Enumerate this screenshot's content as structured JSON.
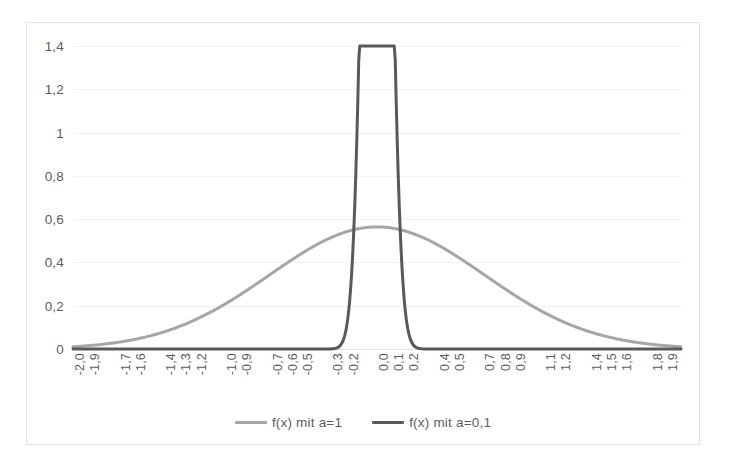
{
  "chart_data": {
    "type": "line",
    "title": "",
    "subtitle": "",
    "xlabel": "",
    "ylabel": "",
    "xlim": [
      -2.0,
      2.0
    ],
    "ylim": [
      0,
      1.4
    ],
    "grid": true,
    "legend_position": "bottom",
    "y_ticks": [
      "0",
      "0,2",
      "0,4",
      "0,6",
      "0,8",
      "1",
      "1,2",
      "1,4"
    ],
    "y_tick_values": [
      0,
      0.2,
      0.4,
      0.6,
      0.8,
      1.0,
      1.2,
      1.4
    ],
    "x_tick_labels": [
      "-2,0",
      "-1,9",
      "-1,7",
      "-1,6",
      "-1,4",
      "-1,3",
      "-1,2",
      "-1,0",
      "-0,9",
      "-0,7",
      "-0,6",
      "-0,5",
      "-0,3",
      "-0,2",
      "0,0",
      "0,1",
      "0,2",
      "0,4",
      "0,5",
      "0,7",
      "0,8",
      "0,9",
      "1,1",
      "1,2",
      "1,4",
      "1,5",
      "1,6",
      "1,8",
      "1,9"
    ],
    "x_tick_values": [
      -2.0,
      -1.9,
      -1.7,
      -1.6,
      -1.4,
      -1.3,
      -1.2,
      -1.0,
      -0.9,
      -0.7,
      -0.6,
      -0.5,
      -0.3,
      -0.2,
      0.0,
      0.1,
      0.2,
      0.4,
      0.5,
      0.7,
      0.8,
      0.9,
      1.1,
      1.2,
      1.4,
      1.5,
      1.6,
      1.8,
      1.9
    ],
    "series": [
      {
        "name": "f(x) mit a=1",
        "color": "#a6a6a6",
        "a": 1,
        "peak": 0.5642,
        "x": [
          -2.0,
          -1.9,
          -1.8,
          -1.7,
          -1.6,
          -1.5,
          -1.4,
          -1.3,
          -1.2,
          -1.1,
          -1.0,
          -0.9,
          -0.8,
          -0.7,
          -0.6,
          -0.5,
          -0.4,
          -0.3,
          -0.2,
          -0.1,
          0.0,
          0.1,
          0.2,
          0.3,
          0.4,
          0.5,
          0.6,
          0.7,
          0.8,
          0.9,
          1.0,
          1.1,
          1.2,
          1.3,
          1.4,
          1.5,
          1.6,
          1.7,
          1.8,
          1.9,
          2.0
        ],
        "values": [
          0.0103,
          0.0153,
          0.0222,
          0.0314,
          0.0435,
          0.0594,
          0.0794,
          0.1043,
          0.1341,
          0.169,
          0.2076,
          0.2491,
          0.2916,
          0.3332,
          0.3718,
          0.4394,
          0.4807,
          0.5157,
          0.5421,
          0.5586,
          0.5642,
          0.5586,
          0.5421,
          0.5157,
          0.4807,
          0.4394,
          0.3935,
          0.3455,
          0.2975,
          0.2514,
          0.2076,
          0.169,
          0.1341,
          0.1043,
          0.0794,
          0.0594,
          0.0435,
          0.0314,
          0.0222,
          0.0153,
          0.0103
        ]
      },
      {
        "name": "f(x) mit a=0,1",
        "color": "#595959",
        "a": 0.1,
        "peak": 1.2616,
        "x": [
          -2.0,
          -1.5,
          -1.0,
          -0.7,
          -0.6,
          -0.5,
          -0.45,
          -0.4,
          -0.35,
          -0.3,
          -0.25,
          -0.2,
          -0.15,
          -0.1,
          -0.05,
          0.0,
          0.05,
          0.1,
          0.15,
          0.2,
          0.25,
          0.3,
          0.35,
          0.4,
          0.45,
          0.5,
          0.6,
          0.7,
          1.0,
          1.5,
          2.0
        ],
        "values": [
          0.0,
          0.0,
          0.0,
          0.0,
          0.0,
          0.0021,
          0.0088,
          0.0304,
          0.0886,
          0.2164,
          0.443,
          0.7607,
          1.0392,
          1.2045,
          1.2616,
          1.2616,
          1.2616,
          1.2045,
          1.0392,
          0.7607,
          0.443,
          0.2164,
          0.0886,
          0.0304,
          0.0088,
          0.0021,
          0.0,
          0.0,
          0.0,
          0.0,
          0.0
        ]
      }
    ],
    "legend": [
      {
        "label": "f(x) mit a=1",
        "color": "#a6a6a6"
      },
      {
        "label": "f(x) mit a=0,1",
        "color": "#595959"
      }
    ]
  },
  "colors": {
    "series_light": "#a6a6a6",
    "series_dark": "#595959",
    "gridline": "#f2f2f2",
    "axis": "#e0e0e0",
    "frame_border": "#e3e3e3",
    "tick_text": "#5d5d5d",
    "background": "#ffffff"
  }
}
